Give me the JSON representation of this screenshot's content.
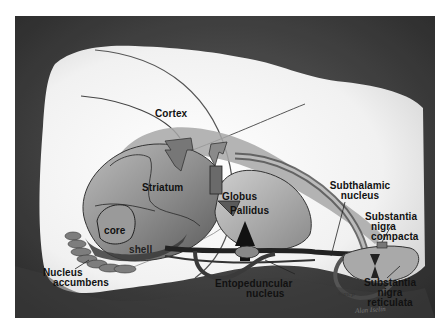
{
  "figure": {
    "type": "anatomical illustration",
    "style": "grayscale airbrush illustration",
    "colors": {
      "background_dark": "#3a3a3a",
      "brain_light": "#f2f2f2",
      "structure_mid": "#8c8c8c",
      "structure_dark": "#2a2a2a",
      "label_text": "#111111"
    }
  },
  "labels": {
    "cortex": "Cortex",
    "striatum": "Striatum",
    "globus": "Globus",
    "pallidus": "Pallidus",
    "subthalamic_line1": "Subthalamic",
    "subthalamic_line2": "nucleus",
    "snc_line1": "Substantia",
    "snc_line2": "nigra",
    "snc_line3": "compacta",
    "core": "core",
    "shell": "shell",
    "nacc_line1": "Nucleus",
    "nacc_line2": "accumbens",
    "ep_line1": "Entopeduncular",
    "ep_line2": "nucleus",
    "snr_line1": "Substantia",
    "snr_line2": "nigra",
    "snr_line3": "reticulata"
  },
  "credits": {
    "copyright": "©mcp",
    "signature": "Alan Iselin"
  }
}
